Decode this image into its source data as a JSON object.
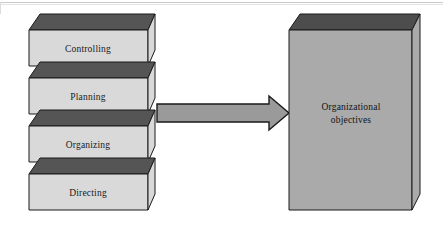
{
  "page": {
    "background_color": "#ffffff"
  },
  "colors": {
    "slab_front": "#d9d9d9",
    "slab_top": "#555555",
    "slab_outline": "#1a1a1a",
    "goal_front": "#aaaaaa",
    "goal_top": "#4d4d4d",
    "goal_outline": "#1a1a1a",
    "arrow_fill": "#9a9a9a",
    "arrow_outline": "#1a1a1a",
    "rule": "#c9c9c9"
  },
  "stack": {
    "name": "management-functions-stack",
    "slabs": [
      {
        "label": "Controlling",
        "order": 1
      },
      {
        "label": "Planning",
        "order": 2
      },
      {
        "label": "Organizing",
        "order": 3
      },
      {
        "label": "Directing",
        "order": 4
      }
    ]
  },
  "arrow": {
    "name": "flow-arrow",
    "direction": "right",
    "label": ""
  },
  "goal": {
    "name": "organizational-objectives-box",
    "line1": "Organizational",
    "line2": "objectives"
  }
}
